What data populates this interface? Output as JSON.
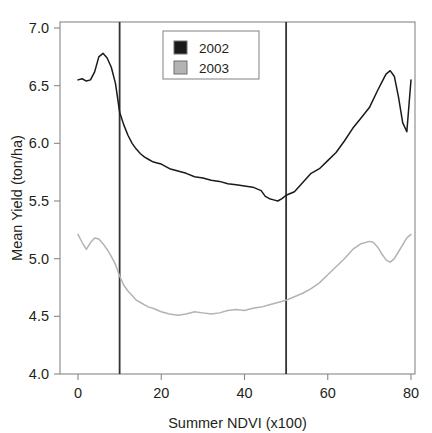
{
  "chart_data": {
    "type": "line",
    "title": "",
    "xlabel": "Summer NDVI (x100)",
    "ylabel": "Mean Yield (ton/ha)",
    "xlim": [
      -2,
      80
    ],
    "ylim": [
      4.0,
      7.1
    ],
    "xticks": [
      0,
      20,
      40,
      60,
      80
    ],
    "xtick_labels": [
      "0",
      "20",
      "40",
      "60",
      "80"
    ],
    "yticks": [
      4.0,
      4.5,
      5.0,
      5.5,
      6.0,
      6.5,
      7.0
    ],
    "ytick_labels": [
      "4.0",
      "4.5",
      "5.0",
      "5.5",
      "6.0",
      "6.5",
      "7.0"
    ],
    "grid": false,
    "legend_position": "upper-center",
    "legend_entries": [
      {
        "label": "2002",
        "color": "#1a1a1a",
        "marker": "filled-square"
      },
      {
        "label": "2003",
        "color": "#b3b3b3",
        "marker": "filled-square"
      }
    ],
    "vertical_reference_lines": [
      {
        "x": 10,
        "color": "#333333"
      },
      {
        "x": 50,
        "color": "#333333"
      }
    ],
    "series": [
      {
        "name": "2002",
        "color": "#1a1a1a",
        "x": [
          0,
          1,
          2,
          3,
          4,
          5,
          6,
          7,
          8,
          9,
          10,
          11,
          12,
          13,
          14,
          15,
          16,
          17,
          18,
          19,
          20,
          22,
          24,
          26,
          28,
          30,
          32,
          34,
          36,
          38,
          40,
          42,
          44,
          45,
          46,
          47,
          48,
          49,
          50,
          52,
          54,
          56,
          58,
          60,
          62,
          64,
          66,
          68,
          70,
          72,
          73,
          74,
          75,
          76,
          77,
          78,
          79,
          80
        ],
        "values": [
          6.55,
          6.56,
          6.54,
          6.55,
          6.62,
          6.75,
          6.78,
          6.74,
          6.66,
          6.52,
          6.27,
          6.16,
          6.07,
          6.0,
          5.95,
          5.91,
          5.88,
          5.86,
          5.84,
          5.83,
          5.82,
          5.78,
          5.76,
          5.74,
          5.71,
          5.7,
          5.68,
          5.67,
          5.65,
          5.64,
          5.63,
          5.62,
          5.59,
          5.54,
          5.52,
          5.51,
          5.5,
          5.52,
          5.55,
          5.58,
          5.66,
          5.74,
          5.78,
          5.85,
          5.92,
          6.02,
          6.13,
          6.22,
          6.31,
          6.46,
          6.53,
          6.6,
          6.63,
          6.58,
          6.4,
          6.18,
          6.1,
          6.55
        ]
      },
      {
        "name": "2003",
        "color": "#b3b3b3",
        "x": [
          0,
          1,
          2,
          3,
          4,
          5,
          6,
          7,
          8,
          9,
          10,
          11,
          12,
          13,
          14,
          15,
          16,
          17,
          18,
          20,
          22,
          24,
          26,
          28,
          30,
          32,
          34,
          36,
          38,
          40,
          42,
          44,
          46,
          48,
          50,
          52,
          54,
          56,
          58,
          60,
          62,
          64,
          66,
          68,
          70,
          71,
          72,
          73,
          74,
          75,
          76,
          77,
          78,
          79,
          80
        ],
        "values": [
          5.21,
          5.14,
          5.08,
          5.14,
          5.18,
          5.17,
          5.13,
          5.08,
          5.02,
          4.95,
          4.85,
          4.77,
          4.72,
          4.68,
          4.64,
          4.62,
          4.6,
          4.58,
          4.57,
          4.54,
          4.52,
          4.51,
          4.52,
          4.54,
          4.53,
          4.52,
          4.53,
          4.55,
          4.56,
          4.55,
          4.57,
          4.58,
          4.6,
          4.62,
          4.64,
          4.67,
          4.7,
          4.74,
          4.79,
          4.86,
          4.93,
          5.0,
          5.08,
          5.13,
          5.15,
          5.14,
          5.1,
          5.04,
          4.99,
          4.97,
          5.0,
          5.06,
          5.12,
          5.18,
          5.21
        ]
      }
    ]
  }
}
